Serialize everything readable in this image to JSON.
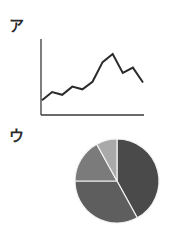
{
  "panels": {
    "a": {
      "label": "ア"
    },
    "u": {
      "label": "ウ"
    }
  },
  "colors": {
    "line": "#2b2b2b",
    "axis": "#3a3a3a",
    "slice_darkest": "#4a4a4a",
    "slice_dark": "#5e5e5e",
    "slice_medium": "#7b7b7b",
    "slice_light": "#a9a9a9",
    "separator": "#f2f2f2"
  },
  "chart_data": [
    {
      "type": "line",
      "title": "ア",
      "xlabel": "",
      "ylabel": "",
      "grid": false,
      "legend": "none",
      "axis_ticks": false,
      "x": [
        1,
        2,
        3,
        4,
        5,
        6,
        7,
        8,
        9,
        10,
        11
      ],
      "values": [
        10,
        22,
        18,
        30,
        26,
        37,
        66,
        78,
        50,
        58,
        36
      ],
      "ylim": [
        0,
        100
      ],
      "note": "No tick labels shown; values are relative heights estimated from pixels"
    },
    {
      "type": "pie",
      "title": "ウ",
      "legend": "none",
      "start_angle": "12 o'clock, clockwise",
      "slices": [
        {
          "name": "slice-1",
          "value": 42,
          "shade": "darkest"
        },
        {
          "name": "slice-2",
          "value": 33,
          "shade": "dark"
        },
        {
          "name": "slice-3",
          "value": 17,
          "shade": "medium"
        },
        {
          "name": "slice-4",
          "value": 8,
          "shade": "light"
        }
      ],
      "note": "No labels shown; percentages estimated from slice angles"
    }
  ]
}
